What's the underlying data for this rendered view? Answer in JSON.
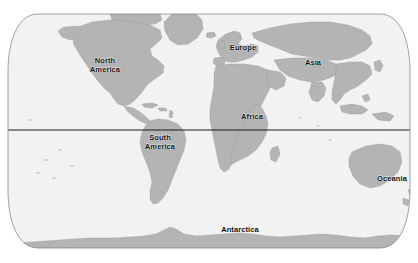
{
  "figure": {
    "type": "world-map",
    "projection": "robinson",
    "width": 418,
    "height": 263
  },
  "colors": {
    "background": "#ffffff",
    "ocean": "#f2f2f2",
    "land": "#b4b4b4",
    "land_light": "#d2d2d2",
    "outline": "#8a8a8a",
    "graticule": "#1a1a1a",
    "label": "#0d0d0d"
  },
  "map": {
    "frame": {
      "top": 14,
      "bottom": 248,
      "left": 8,
      "right": 410
    },
    "equator": {
      "name": "equator-line",
      "y": 130
    }
  },
  "labels": [
    {
      "id": "north-america",
      "text": "North\nAmerica",
      "x": 105,
      "y": 65
    },
    {
      "id": "south-america",
      "text": "South\nAmerica",
      "x": 160,
      "y": 142
    },
    {
      "id": "europe",
      "text": "Europe",
      "x": 243,
      "y": 48
    },
    {
      "id": "africa",
      "text": "Africa",
      "x": 252,
      "y": 117
    },
    {
      "id": "asia",
      "text": "Asia",
      "x": 313,
      "y": 63
    },
    {
      "id": "oceania",
      "text": "Oceania",
      "x": 392,
      "y": 179
    },
    {
      "id": "antarctica",
      "text": "Antarctica",
      "x": 240,
      "y": 230
    }
  ]
}
